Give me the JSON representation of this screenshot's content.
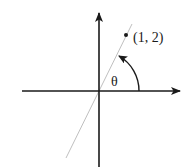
{
  "diagram": {
    "type": "coordinate-plane-angle",
    "point_label": "(1, 2)",
    "angle_label": "θ",
    "point": {
      "x": 1,
      "y": 2
    },
    "colors": {
      "axes": "#1a1a1a",
      "ray": "#b8b8b8",
      "arc": "#1a1a1a",
      "text": "#1a1a1a",
      "background": "#ffffff"
    }
  }
}
